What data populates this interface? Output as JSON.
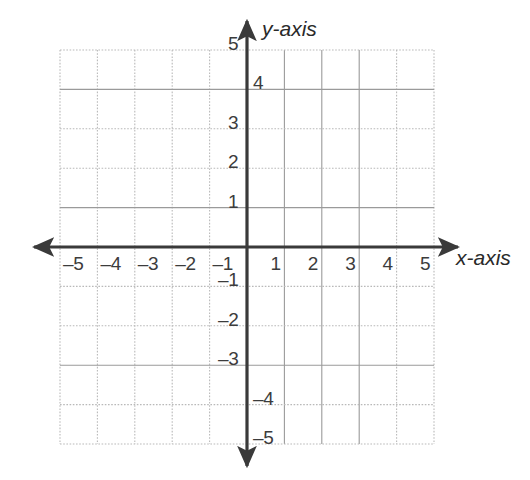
{
  "figure": {
    "kind": "cartesian-coordinate-grid",
    "background_color": "#ffffff",
    "axis_color": "#3a3a3a",
    "grid_color": "#b9b9b9",
    "grid_color_strong": "#9a9a9a",
    "label_color": "#3c3c3c"
  },
  "axis_labels": {
    "x": "x-axis",
    "y": "y-axis"
  },
  "chart_data": {
    "type": "scatter",
    "title": "",
    "subtitle": "",
    "xlabel": "x-axis",
    "ylabel": "y-axis",
    "xlim": [
      -5.5,
      5.5
    ],
    "ylim": [
      -5.5,
      5.5
    ],
    "xticks": [
      -5,
      -4,
      -3,
      -2,
      -1,
      1,
      2,
      3,
      4,
      5
    ],
    "yticks": [
      5,
      4,
      3,
      2,
      1,
      -1,
      -2,
      -3,
      -4,
      -5
    ],
    "xticklabels": [
      "–5",
      "–4",
      "–3",
      "–2",
      "–1",
      "1",
      "2",
      "3",
      "4",
      "5"
    ],
    "yticklabels": [
      "5",
      "4",
      "3",
      "2",
      "1",
      "–1",
      "–2",
      "–3",
      "–4",
      "–5"
    ],
    "grid": true,
    "grid_step": 1,
    "legend": null,
    "series": [],
    "x": [],
    "values": [],
    "annotations": [],
    "axis_arrows": [
      "left",
      "right",
      "up",
      "down"
    ],
    "origin_marked": false
  },
  "x_ticks": [
    {
      "value": -5,
      "label": "–5",
      "side": "right-of-line"
    },
    {
      "value": -4,
      "label": "–4",
      "side": "right-of-line"
    },
    {
      "value": -3,
      "label": "–3",
      "side": "right-of-line"
    },
    {
      "value": -2,
      "label": "–2",
      "side": "right-of-line"
    },
    {
      "value": -1,
      "label": "–1",
      "side": "right-of-line"
    },
    {
      "value": 1,
      "label": "1",
      "side": "left-of-line"
    },
    {
      "value": 2,
      "label": "2",
      "side": "left-of-line"
    },
    {
      "value": 3,
      "label": "3",
      "side": "left-of-line"
    },
    {
      "value": 4,
      "label": "4",
      "side": "left-of-line"
    },
    {
      "value": 5,
      "label": "5",
      "side": "left-of-line"
    }
  ],
  "y_ticks": [
    {
      "value": 5,
      "label": "5",
      "side": "left-of-axis"
    },
    {
      "value": 4,
      "label": "4",
      "side": "right-of-axis"
    },
    {
      "value": 3,
      "label": "3",
      "side": "left-of-axis"
    },
    {
      "value": 2,
      "label": "2",
      "side": "left-of-axis"
    },
    {
      "value": 1,
      "label": "1",
      "side": "left-of-axis"
    },
    {
      "value": -1,
      "label": "–1",
      "side": "left-of-axis"
    },
    {
      "value": -2,
      "label": "–2",
      "side": "left-of-axis"
    },
    {
      "value": -3,
      "label": "–3",
      "side": "left-of-axis"
    },
    {
      "value": -4,
      "label": "–4",
      "side": "right-of-axis"
    },
    {
      "value": -5,
      "label": "–5",
      "side": "right-of-axis"
    }
  ]
}
